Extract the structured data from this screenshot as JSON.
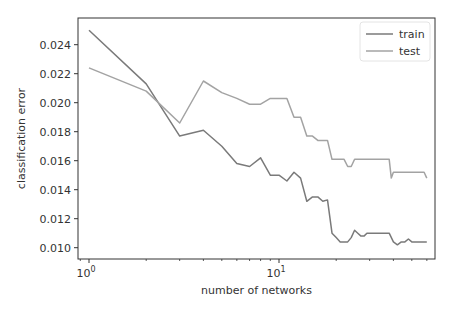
{
  "chart_data": {
    "type": "line",
    "title": "",
    "xlabel": "number of networks",
    "ylabel": "classification error",
    "xscale": "log",
    "xlim": [
      0.9,
      75
    ],
    "ylim": [
      0.0098,
      0.0257
    ],
    "grid": false,
    "legend_position": "upper right",
    "x_ticks": [
      {
        "value": 1,
        "label_base": "10",
        "label_exp": "0"
      },
      {
        "value": 10,
        "label_base": "10",
        "label_exp": "1"
      }
    ],
    "y_ticks": [
      0.01,
      0.012,
      0.014,
      0.016,
      0.018,
      0.02,
      0.022,
      0.024
    ],
    "y_tick_labels": [
      "0.010",
      "0.012",
      "0.014",
      "0.016",
      "0.018",
      "0.020",
      "0.022",
      "0.024"
    ],
    "series": [
      {
        "name": "train",
        "color": "#7a7a7a",
        "x": [
          1,
          2,
          3,
          4,
          5,
          6,
          7,
          8,
          9,
          10,
          11,
          12,
          13,
          14,
          15,
          16,
          17,
          18,
          19,
          20,
          21,
          22,
          23,
          24,
          25,
          26,
          27,
          28,
          29,
          30,
          32,
          34,
          36,
          38,
          40,
          42,
          44,
          46,
          48,
          50,
          52,
          55,
          58,
          60
        ],
        "y": [
          0.025,
          0.0213,
          0.0177,
          0.0181,
          0.017,
          0.0158,
          0.0156,
          0.0162,
          0.015,
          0.015,
          0.0146,
          0.0152,
          0.0148,
          0.0132,
          0.0135,
          0.0135,
          0.0132,
          0.0133,
          0.011,
          0.0107,
          0.0104,
          0.0104,
          0.0104,
          0.0107,
          0.0112,
          0.011,
          0.0108,
          0.0108,
          0.011,
          0.011,
          0.011,
          0.011,
          0.011,
          0.011,
          0.0104,
          0.0102,
          0.0104,
          0.0104,
          0.0106,
          0.0104,
          0.0104,
          0.0104,
          0.0104,
          0.0104
        ]
      },
      {
        "name": "test",
        "color": "#a3a3a3",
        "x": [
          1,
          2,
          3,
          4,
          5,
          6,
          7,
          8,
          9,
          10,
          11,
          12,
          13,
          14,
          15,
          16,
          17,
          18,
          19,
          20,
          21,
          22,
          23,
          24,
          25,
          26,
          28,
          30,
          32,
          34,
          36,
          38,
          39,
          40,
          44,
          48,
          52,
          55,
          58,
          60
        ],
        "y": [
          0.0224,
          0.0208,
          0.0186,
          0.0215,
          0.0207,
          0.0203,
          0.0199,
          0.0199,
          0.0203,
          0.0203,
          0.0203,
          0.019,
          0.019,
          0.0177,
          0.0177,
          0.0174,
          0.0174,
          0.0174,
          0.0161,
          0.0161,
          0.0161,
          0.0161,
          0.0156,
          0.0156,
          0.0161,
          0.0161,
          0.0161,
          0.0161,
          0.0161,
          0.0161,
          0.0161,
          0.0161,
          0.0148,
          0.0152,
          0.0152,
          0.0152,
          0.0152,
          0.0152,
          0.0152,
          0.0148
        ]
      }
    ]
  },
  "layout": {
    "plot_left": 78,
    "plot_right": 435,
    "plot_top": 18,
    "plot_bottom": 259,
    "x_origin_px": 89,
    "px_per_decade": 190,
    "y_ref_value": 0.024,
    "y_ref_px": 44.7,
    "px_per_unit": 14500
  }
}
